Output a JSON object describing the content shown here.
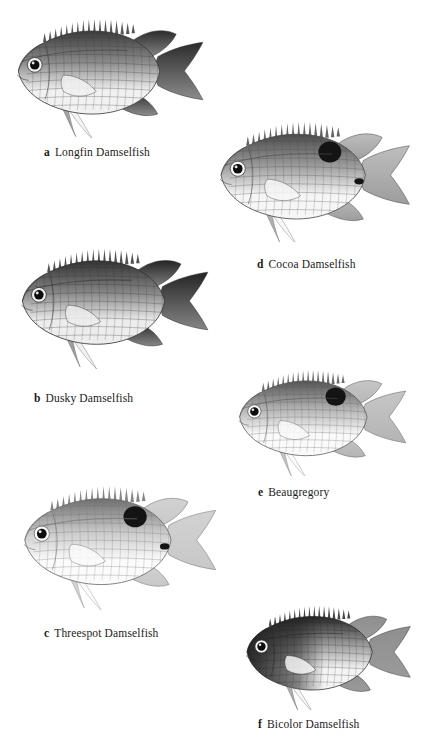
{
  "plate": {
    "background": "#ffffff",
    "width": 444,
    "height": 740,
    "ink": "#1a1a1a"
  },
  "figures": [
    {
      "key": "a",
      "label": "a",
      "name": "Longfin Damselfish",
      "caption_x": 44,
      "caption_y": 146,
      "fish_x": 4,
      "fish_y": 2,
      "fish_w": 205,
      "fish_h": 136,
      "body_tone": "dark",
      "body_light": "#f1f1f1",
      "body_mid": "#8c8c8c",
      "body_dark": "#3a3a3a",
      "tail_tone": "#2b2b2b",
      "has_dorsal_spot": false,
      "has_pectoral_spot": false,
      "long_pelvic": true,
      "eye_ring": true
    },
    {
      "key": "d",
      "label": "d",
      "name": "Cocoa Damselfish",
      "caption_x": 257,
      "caption_y": 258,
      "fish_x": 206,
      "fish_y": 106,
      "fish_w": 210,
      "fish_h": 136,
      "body_tone": "mid",
      "body_light": "#f6f6f6",
      "body_mid": "#9d9d9d",
      "body_dark": "#4a4a4a",
      "tail_tone": "#bdbdbd",
      "has_dorsal_spot": true,
      "has_pectoral_spot": true,
      "long_pelvic": true,
      "eye_ring": true
    },
    {
      "key": "b",
      "label": "b",
      "name": "Dusky Damselfish",
      "caption_x": 34,
      "caption_y": 392,
      "fish_x": 8,
      "fish_y": 227,
      "fish_w": 206,
      "fish_h": 146,
      "body_tone": "dark",
      "body_light": "#ededed",
      "body_mid": "#868686",
      "body_dark": "#323232",
      "tail_tone": "#242424",
      "has_dorsal_spot": false,
      "has_pectoral_spot": false,
      "long_pelvic": true,
      "eye_ring": true
    },
    {
      "key": "e",
      "label": "e",
      "name": "Beaugregory",
      "caption_x": 258,
      "caption_y": 486,
      "fish_x": 212,
      "fish_y": 356,
      "fish_w": 214,
      "fish_h": 120,
      "body_tone": "light",
      "body_light": "#fafafa",
      "body_mid": "#b4b4b4",
      "body_dark": "#535353",
      "tail_tone": "#c6c6c6",
      "has_dorsal_spot": true,
      "has_pectoral_spot": false,
      "long_pelvic": true,
      "eye_ring": true
    },
    {
      "key": "c",
      "label": "c",
      "name": "Threespot Damselfish",
      "caption_x": 44,
      "caption_y": 627,
      "fish_x": 10,
      "fish_y": 465,
      "fish_w": 212,
      "fish_h": 148,
      "body_tone": "pale",
      "body_light": "#fbfbfb",
      "body_mid": "#c8c8c8",
      "body_dark": "#6e6e6e",
      "tail_tone": "#d2d2d2",
      "has_dorsal_spot": true,
      "has_pectoral_spot": true,
      "long_pelvic": true,
      "eye_ring": true
    },
    {
      "key": "f",
      "label": "f",
      "name": "Bicolor Damselfish",
      "caption_x": 258,
      "caption_y": 718,
      "fish_x": 216,
      "fish_y": 592,
      "fish_w": 218,
      "fish_h": 118,
      "body_tone": "bicolor",
      "body_light": "#f4f4f4",
      "body_mid": "#9a9a9a",
      "body_dark": "#262626",
      "tail_tone": "#8f8f8f",
      "has_dorsal_spot": false,
      "has_pectoral_spot": false,
      "long_pelvic": true,
      "eye_ring": true
    }
  ]
}
